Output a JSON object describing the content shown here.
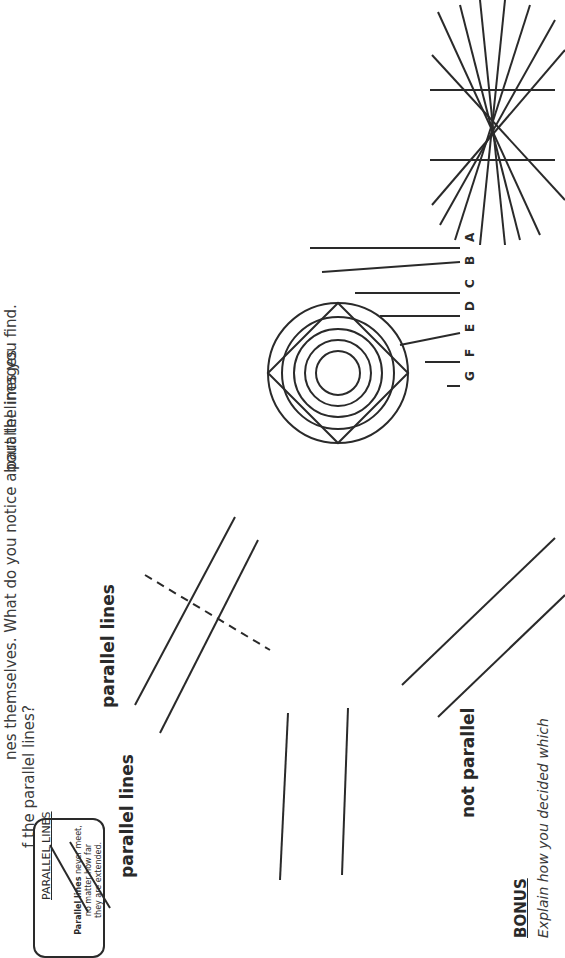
{
  "worksheet": {
    "intro_line1": "nes themselves. What do you notice about the images",
    "intro_line2": "f the parallel lines?",
    "intro_line3": "parallel lines you find.",
    "definition_box": {
      "title": "PARALLEL LINES",
      "text_bold": "Parallel lines",
      "text_line1": " never meet,",
      "text_line2": "no matter how far",
      "text_line3": "they are extended."
    },
    "labels": {
      "parallel_lines_1": "parallel lines",
      "parallel_lines_2": "parallel lines",
      "not_parallel": "not parallel"
    },
    "line_letters": [
      "A",
      "B",
      "C",
      "D",
      "E",
      "F",
      "G"
    ],
    "bonus": {
      "title": "BONUS",
      "text": "Explain how you decided which"
    }
  },
  "colors": {
    "ink": "#2a2a2a",
    "background": "#ffffff"
  }
}
